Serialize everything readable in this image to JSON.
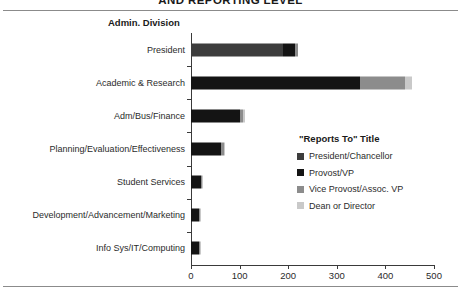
{
  "chart_data": {
    "type": "bar",
    "orientation": "horizontal",
    "stacked": true,
    "title": "AND REPORTING LEVEL",
    "axis_title": "Admin. Division",
    "xlabel": "",
    "ylabel": "Admin. Division",
    "xlim": [
      0,
      500
    ],
    "xticks": [
      0,
      100,
      200,
      300,
      400,
      500
    ],
    "xtick_labels": [
      "0",
      "100",
      "200",
      "300",
      "400",
      "500"
    ],
    "grid": false,
    "legend_position": "inside-right",
    "legend_title": "\"Reports To\"  Title",
    "categories": [
      "President",
      "Academic & Research",
      "Adm/Bus/Finance",
      "Planning/Evaluation/Effectiveness",
      "Student Services",
      "Development/Advancement/Marketing",
      "Info Sys/IT/Computing"
    ],
    "series": [
      {
        "name": "President/Chancellor",
        "color": "#3d3d3d",
        "values": [
          190,
          0,
          0,
          0,
          0,
          0,
          0
        ]
      },
      {
        "name": "Provost/VP",
        "color": "#141414",
        "values": [
          25,
          347,
          100,
          62,
          20,
          16,
          16
        ]
      },
      {
        "name": "Vice Provost/Assoc. VP",
        "color": "#8c8c8c",
        "values": [
          6,
          93,
          8,
          6,
          3,
          2,
          2
        ]
      },
      {
        "name": "Dean or Director",
        "color": "#c9c9c9",
        "values": [
          0,
          15,
          3,
          2,
          1,
          1,
          1
        ]
      }
    ],
    "totals": [
      221,
      455,
      111,
      70,
      24,
      19,
      19
    ]
  },
  "colors": {
    "axis": "#3a3a3a",
    "rule": "#8b8b8b",
    "text": "#2b2b2b",
    "title_text": "#1a1a1a"
  }
}
